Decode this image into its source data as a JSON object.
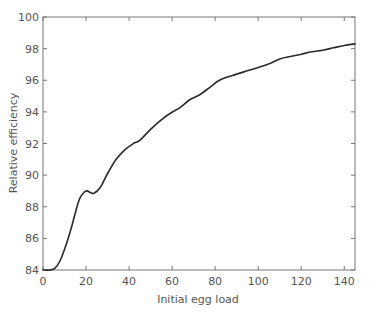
{
  "chart_data": {
    "type": "line",
    "title": "",
    "xlabel": "Initial egg load",
    "ylabel": "Relative efficiency",
    "xlim": [
      0,
      145
    ],
    "ylim": [
      84,
      100
    ],
    "xticks": [
      0,
      20,
      40,
      60,
      80,
      100,
      120,
      140
    ],
    "yticks": [
      84,
      86,
      88,
      90,
      92,
      94,
      96,
      98,
      100
    ],
    "grid": false,
    "legend": null,
    "line_color": "#2a2a2a",
    "axis_color": "#777777",
    "series": [
      {
        "name": "Relative efficiency",
        "x": [
          0,
          3,
          5.5,
          8,
          10,
          13,
          15,
          17,
          19,
          20.5,
          22,
          23.7,
          26.5,
          30,
          34,
          38,
          42,
          45,
          50,
          55,
          59,
          64,
          68,
          73,
          78,
          82,
          88,
          95,
          101,
          106,
          110,
          115,
          120,
          125,
          130,
          135,
          140,
          145
        ],
        "y": [
          84.0,
          84.0,
          84.1,
          84.6,
          85.3,
          86.6,
          87.6,
          88.5,
          88.9,
          89.0,
          88.9,
          88.85,
          89.2,
          90.1,
          91.0,
          91.6,
          92.0,
          92.2,
          92.9,
          93.5,
          93.9,
          94.3,
          94.75,
          95.1,
          95.6,
          96.0,
          96.3,
          96.6,
          96.85,
          97.1,
          97.35,
          97.5,
          97.65,
          97.8,
          97.9,
          98.05,
          98.2,
          98.3
        ]
      }
    ]
  }
}
